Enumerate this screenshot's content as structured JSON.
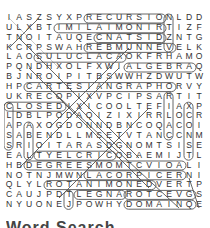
{
  "puzzle": {
    "rows": [
      "IASZSYXPRECURSIONLDD",
      "ULXBTIMILAIMONIRTIZF",
      "TNOITAUQECNATSIDZNTG",
      "KCRPSWAHREBMUNNEVELK",
      "LAOSULUCLACAOKFRHAMO",
      "PQNDHXOLFXWIALGEBRAQ",
      "BJNROIPITBSWWHZDWUTW",
      "HPCARTESIANGRAPHORVY",
      "UKRECOPIXVPCIPSARTIT",
      "CLOSEDIXICOOLTEFIAXP",
      "LDBLPODAQIZIXIRRLOCR",
      "APAXOGDONNDBNCOQACOI",
      "SABENDLLMSETVTANCCNM",
      "SRIOITARASDGNOMTSISE",
      "EALTYELCRICOBAEMIJTL",
      "HBDEGREESMOMTCVIOALI",
      "NOTNJMWNLACORPICERNI",
      "QLYLROTANIMONEDVERTP",
      "CAUJPDTLEGNAROTCEVGS",
      "NYUONEJPOWHYDOMAINQE"
    ],
    "found_words": [
      "RECURSION",
      "LIMIT",
      "EQUATION",
      "DISTANCE",
      "NUMBER",
      "LEVEL",
      "CALCULUS",
      "ALGEBRA",
      "CARTESIAN GRAPH",
      "CLOSED",
      "RATIO",
      "CIRCLE",
      "DEGREES",
      "RECIPROCAL",
      "DENOMINATOR",
      "ANGLE",
      "VECTOR",
      "DOMAIN",
      "PRIME",
      "RADIAL"
    ]
  },
  "footer": {
    "partial_text": "Word Search"
  }
}
